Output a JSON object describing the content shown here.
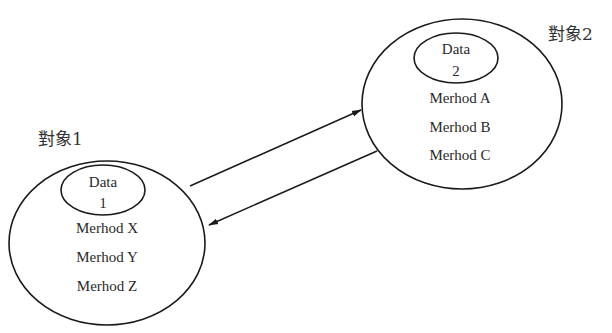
{
  "objects": [
    {
      "label": "對象1",
      "data_label": "Data",
      "data_number": "1",
      "methods": [
        "Merhod X",
        "Merhod Y",
        "Merhod Z"
      ]
    },
    {
      "label": "對象2",
      "data_label": "Data",
      "data_number": "2",
      "methods": [
        "Merhod A",
        "Merhod B",
        "Merhod C"
      ]
    }
  ],
  "edges": [
    {
      "from": "對象1",
      "to": "對象2"
    },
    {
      "from": "對象2",
      "to": "對象1"
    }
  ],
  "colors": {
    "stroke": "#1a1a1a",
    "text": "#2a2a2a",
    "background": "#ffffff"
  }
}
